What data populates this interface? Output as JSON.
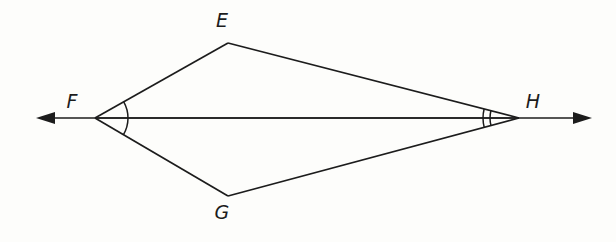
{
  "figure": {
    "shape_name": "kite-efgh",
    "background_color": "#fdfdfb",
    "line_color": "#1c1c1c",
    "vertices": [
      {
        "label": "E",
        "x": 228,
        "y": 43,
        "label_x": 222,
        "label_y": 27,
        "name": "vertex-e"
      },
      {
        "label": "F",
        "x": 95,
        "y": 118,
        "label_x": 72,
        "label_y": 108,
        "name": "vertex-f"
      },
      {
        "label": "G",
        "x": 228,
        "y": 196,
        "label_x": 222,
        "label_y": 219,
        "name": "vertex-g"
      },
      {
        "label": "H",
        "x": 519,
        "y": 118,
        "label_x": 527,
        "label_y": 108,
        "name": "vertex-h"
      }
    ],
    "edges": [
      {
        "name": "edge-ef",
        "from": "F",
        "to": "E"
      },
      {
        "name": "edge-eh",
        "from": "E",
        "to": "H"
      },
      {
        "name": "edge-fg",
        "from": "F",
        "to": "G"
      },
      {
        "name": "edge-gh",
        "from": "G",
        "to": "H"
      }
    ],
    "diagonal": {
      "name": "diagonal-fh",
      "from": "F",
      "to": "H"
    },
    "ray": {
      "name": "line-fh-extended",
      "y": 118,
      "left_tip_x": 36,
      "right_tip_x": 592,
      "left_arrow": true,
      "right_arrow": true,
      "arrow_length": 17,
      "arrow_half_width": 6
    },
    "angle_marks": [
      {
        "name": "angle-mark-f",
        "at_vertex": "F",
        "arc_count": 1,
        "description": "single arc spanning angle EFG",
        "radius": 33
      },
      {
        "name": "angle-mark-h-upper",
        "at_vertex": "H",
        "arc_count": 1,
        "description": "arc spanning angle EHF",
        "radius": 36
      },
      {
        "name": "angle-mark-h-lower",
        "at_vertex": "H",
        "arc_count": 1,
        "description": "arc spanning angle FHG",
        "radius": 29
      }
    ]
  }
}
